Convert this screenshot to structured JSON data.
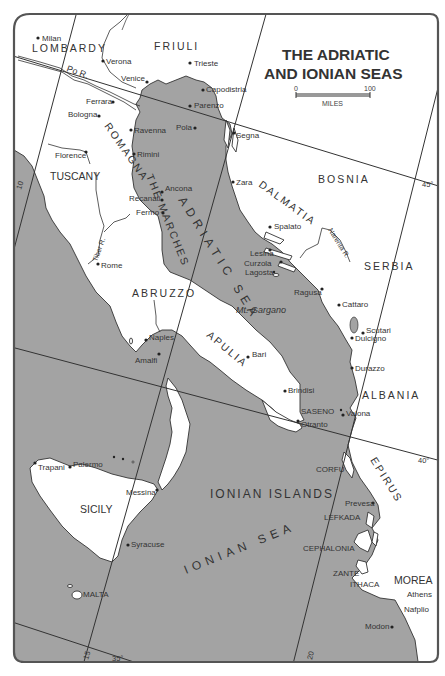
{
  "title": {
    "line1": "THE ADRIATIC",
    "line2": "AND IONIAN SEAS"
  },
  "scale": {
    "start": "0",
    "end": "100",
    "unit": "MILES"
  },
  "regions": {
    "lombardy": "LOMBARDY",
    "friuli": "FRIULI",
    "tuscany": "TUSCANY",
    "romagna": "ROMAGNA",
    "the_marches": "THE MARCHES",
    "abruzzo": "ABRUZZO",
    "apulia": "APULIA",
    "sicily": "SICILY",
    "dalmatia": "DALMATIA",
    "bosnia": "BOSNIA",
    "serbia": "SERBIA",
    "albania": "ALBANIA",
    "epirus": "EPIRUS",
    "morea": "MOREA"
  },
  "seas": {
    "adriatic": "ADRIATIC SEA",
    "ionian": "IONIAN SEA",
    "ionian_islands": "IONIAN ISLANDS"
  },
  "rivers": {
    "po": "Po R.",
    "tiber": "Tiber R.",
    "narenta": "Narenta R."
  },
  "features": {
    "gargano": "Mt. Gargano"
  },
  "cities": {
    "milan": "Milan",
    "verona": "Verona",
    "trieste": "Trieste",
    "venice": "Venice",
    "capodistria": "Capodistria",
    "ferrara": "Ferrara",
    "parenzo": "Parenzo",
    "bologna": "Bologna",
    "pola": "Pola",
    "segna": "Segna",
    "ravenna": "Ravenna",
    "rimini": "Rimini",
    "florence": "Florence",
    "zara": "Zara",
    "ancona": "Ancona",
    "recanati": "Recanati",
    "fermo": "Fermo",
    "spalato": "Spalato",
    "lesina": "Lesina",
    "curzola": "Curzola",
    "lagosta": "Lagosta",
    "rome": "Rome",
    "ragusa": "Ragusa",
    "cattaro": "Cattaro",
    "scutari": "Scutari",
    "dulcigno": "Dulcigno",
    "naples": "Naples",
    "amalfi": "Amalfi",
    "bari": "Bari",
    "durazzo": "Durazzo",
    "brindisi": "Brindisi",
    "saseno": "SASENO",
    "valona": "Valona",
    "otranto": "Otranto",
    "corfu": "CORFU",
    "trapani": "Trapani",
    "palermo": "Palermo",
    "messina": "Messina",
    "prevesa": "Prevesa",
    "lefkada": "LEFKADA",
    "syracuse": "Syracuse",
    "cephalonia": "CEPHALONIA",
    "zante": "ZANTE",
    "ithaca": "ITHACA",
    "athens": "Athens",
    "nafplio": "Nafplio",
    "malta": "MALTA",
    "modon": "Modon"
  },
  "graticule": {
    "lat_45": "45°",
    "lat_40": "40°",
    "lat_35": "35°",
    "lon_10": "10",
    "lon_15": "15",
    "lon_20": "20"
  },
  "colors": {
    "sea": "#a3a3a3",
    "land": "#ffffff",
    "ink": "#333333"
  }
}
